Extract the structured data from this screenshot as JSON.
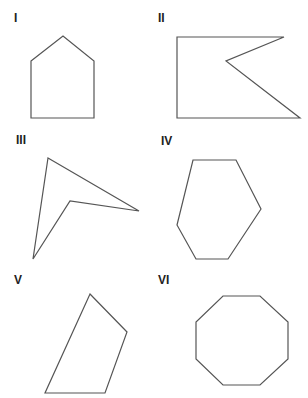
{
  "figure": {
    "stroke_color": "#555555",
    "panels": [
      {
        "label": "I",
        "label_pos": [
          14,
          12
        ],
        "points": "31,61 63,36 94,61 94,118 31,118",
        "shape": "pentagon (house)"
      },
      {
        "label": "II",
        "label_pos": [
          158,
          12
        ],
        "points": "177,37 284,37 226,61 300,118 177,118",
        "shape": "concave pentagon"
      },
      {
        "label": "III",
        "label_pos": [
          16,
          134
        ],
        "points": "48,158 139,211 70,201 33,259",
        "shape": "concave quadrilateral (dart)"
      },
      {
        "label": "IV",
        "label_pos": [
          161,
          135
        ],
        "points": "193,160 236,160 261,209 228,259 196,259 177,225",
        "shape": "irregular hexagon"
      },
      {
        "label": "V",
        "label_pos": [
          14,
          274
        ],
        "points": "90,294 127,332 105,393 45,393",
        "shape": "irregular quadrilateral"
      },
      {
        "label": "VI",
        "label_pos": [
          158,
          274
        ],
        "points": "223,296 260,296 288,322 288,359 260,385 223,385 196,359 196,322",
        "shape": "regular octagon"
      }
    ]
  }
}
